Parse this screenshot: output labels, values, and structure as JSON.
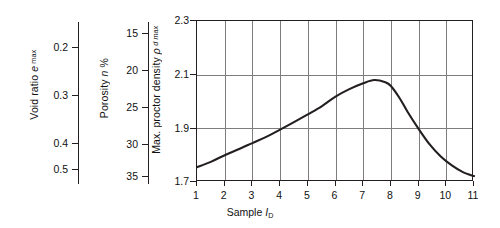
{
  "chart_data": {
    "type": "line",
    "title": "",
    "xlabel": "Sample I_D",
    "xlabel_parts": {
      "text": "Sample ",
      "italic": "I",
      "sub": "D"
    },
    "x": [
      1,
      2,
      3,
      4,
      5,
      6,
      7,
      8,
      9,
      10,
      11
    ],
    "xticklabels": [
      "1",
      "2",
      "3",
      "4",
      "5",
      "6",
      "7",
      "8",
      "9",
      "10",
      "11"
    ],
    "xlim": [
      1,
      11
    ],
    "ylabel": "Max. proctor density ρ_d max",
    "ylabel_parts": {
      "text": "Max. proctor density ",
      "italic": "ρ",
      "sub": "d max"
    },
    "yticklabels": [
      "2.3",
      "2.1",
      "1.9",
      "1.7"
    ],
    "yticks": [
      2.3,
      2.1,
      1.9,
      1.7
    ],
    "ylim": [
      1.7,
      2.3
    ],
    "grid": true,
    "legend": null,
    "line_color": "#231f20",
    "series": [
      {
        "name": "Max. proctor density",
        "values": [
          1.755,
          1.8,
          1.845,
          1.895,
          1.955,
          2.02,
          2.068,
          2.06,
          1.898,
          1.768,
          1.722
        ]
      }
    ],
    "curve_points": [
      [
        1.0,
        1.755
      ],
      [
        1.5,
        1.775
      ],
      [
        2.0,
        1.8
      ],
      [
        2.5,
        1.822
      ],
      [
        3.0,
        1.845
      ],
      [
        3.5,
        1.868
      ],
      [
        4.0,
        1.895
      ],
      [
        4.5,
        1.923
      ],
      [
        5.0,
        1.952
      ],
      [
        5.5,
        1.982
      ],
      [
        6.0,
        2.018
      ],
      [
        6.5,
        2.046
      ],
      [
        7.0,
        2.068
      ],
      [
        7.4,
        2.08
      ],
      [
        7.8,
        2.072
      ],
      [
        8.0,
        2.058
      ],
      [
        8.3,
        2.015
      ],
      [
        8.6,
        1.962
      ],
      [
        9.0,
        1.898
      ],
      [
        9.4,
        1.84
      ],
      [
        9.8,
        1.795
      ],
      [
        10.2,
        1.762
      ],
      [
        10.6,
        1.737
      ],
      [
        11.0,
        1.722
      ]
    ],
    "satellite_axes": [
      {
        "id": "void-ratio",
        "label": "Void ratio e_max",
        "label_parts": {
          "text": "Void ratio ",
          "italic": "e",
          "sub": "max"
        },
        "ticklabels": [
          "0.2",
          "0.3",
          "0.4",
          "0.5"
        ],
        "ticks": [
          0.2,
          0.3,
          0.4,
          0.5
        ],
        "direction": "increasing-downward"
      },
      {
        "id": "porosity",
        "label": "Porosity n %",
        "label_parts": {
          "text": "Porosity ",
          "italic": "n",
          "sub": "",
          "suffix": " %"
        },
        "ticklabels": [
          "15",
          "20",
          "25",
          "30",
          "35"
        ],
        "ticks": [
          15,
          20,
          25,
          30,
          35
        ],
        "direction": "increasing-downward"
      }
    ]
  }
}
